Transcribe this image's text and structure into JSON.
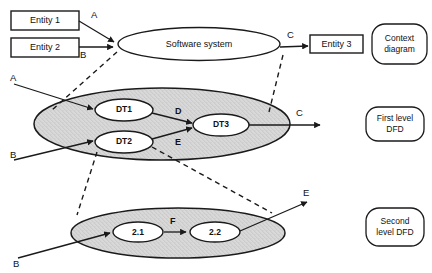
{
  "diagram": {
    "type": "dfd-levelling-diagram",
    "levels": [
      {
        "id": "context",
        "legend": "Context\ndiagram",
        "legend_line1": "Context",
        "legend_line2": "diagram",
        "system_label": "Software system",
        "external_entities": [
          {
            "id": "entity1",
            "label": "Entity 1"
          },
          {
            "id": "entity2",
            "label": "Entity 2"
          },
          {
            "id": "entity3",
            "label": "Entity 3"
          }
        ],
        "flows": [
          {
            "id": "ctx-a",
            "label": "A",
            "from": "entity1",
            "to": "system"
          },
          {
            "id": "ctx-b",
            "label": "B",
            "from": "entity2",
            "to": "system"
          },
          {
            "id": "ctx-c",
            "label": "C",
            "from": "system",
            "to": "entity3"
          }
        ]
      },
      {
        "id": "first-level",
        "legend": "First level\nDFD",
        "legend_line1": "First level",
        "legend_line2": "DFD",
        "processes": [
          {
            "id": "dt1",
            "label": "DT1"
          },
          {
            "id": "dt2",
            "label": "DT2"
          },
          {
            "id": "dt3",
            "label": "DT3"
          }
        ],
        "flows": [
          {
            "id": "l1-a",
            "label": "A",
            "from": "external",
            "to": "dt1"
          },
          {
            "id": "l1-b",
            "label": "B",
            "from": "external",
            "to": "dt2"
          },
          {
            "id": "l1-d",
            "label": "D",
            "from": "dt1",
            "to": "dt3"
          },
          {
            "id": "l1-e",
            "label": "E",
            "from": "dt2",
            "to": "dt3"
          },
          {
            "id": "l1-c",
            "label": "C",
            "from": "dt3",
            "to": "external"
          }
        ]
      },
      {
        "id": "second-level",
        "legend": "Second\nlevel DFD",
        "legend_line1": "Second",
        "legend_line2": "level DFD",
        "processes": [
          {
            "id": "p21",
            "label": "2.1"
          },
          {
            "id": "p22",
            "label": "2.2"
          }
        ],
        "flows": [
          {
            "id": "l2-b",
            "label": "B",
            "from": "external",
            "to": "p21"
          },
          {
            "id": "l2-f",
            "label": "F",
            "from": "p21",
            "to": "p22"
          },
          {
            "id": "l2-e",
            "label": "E",
            "from": "p22",
            "to": "external"
          }
        ]
      }
    ],
    "colors": {
      "stroke": "#1a1a1a",
      "boundary_fill": "#d6d6d6",
      "process_fill": "#ffffff",
      "background": "#ffffff"
    }
  }
}
